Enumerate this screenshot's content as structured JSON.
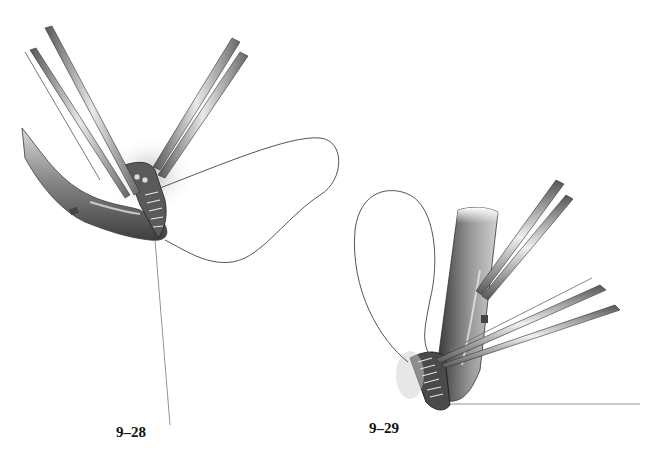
{
  "figures": [
    {
      "id": "fig-28",
      "caption": "9–28",
      "description": "Two forceps instruments grasping a vessel end with a looped suture thread during anastomosis",
      "elements": [
        "forceps-left",
        "forceps-right",
        "vessel",
        "suture-loop",
        "suture-tail"
      ]
    },
    {
      "id": "fig-29",
      "caption": "9–29",
      "description": "Vertical vessel with suture loop and two forceps completing a running anastomosis at the base",
      "elements": [
        "forceps-upper",
        "forceps-lower",
        "vessel",
        "suture-loop",
        "anastomosis-opening",
        "suture-tail"
      ]
    }
  ],
  "colors": {
    "background": "#ffffff",
    "ink_dark": "#2a2a2a",
    "ink_mid": "#6e6e6e",
    "ink_light": "#b5b5b5",
    "caption": "#111111"
  }
}
